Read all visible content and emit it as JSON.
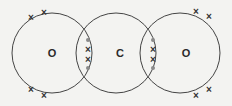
{
  "diagram": {
    "atoms": [
      {
        "label": "O",
        "element": "oxygen",
        "position": "left"
      },
      {
        "label": "C",
        "element": "carbon",
        "position": "center"
      },
      {
        "label": "O",
        "element": "oxygen",
        "position": "right"
      }
    ],
    "bonds": [
      {
        "between": [
          "O",
          "C"
        ],
        "type": "double",
        "electrons": [
          "dot",
          "cross",
          "cross",
          "dot"
        ]
      },
      {
        "between": [
          "C",
          "O"
        ],
        "type": "double",
        "electrons": [
          "dot",
          "cross",
          "cross",
          "dot"
        ]
      }
    ],
    "lone_pairs": {
      "left_oxygen": [
        "cross",
        "cross",
        "cross",
        "cross"
      ],
      "right_oxygen": [
        "cross",
        "cross",
        "cross",
        "cross"
      ]
    },
    "symbols": {
      "cross": "×",
      "dot": "•"
    },
    "colors": {
      "line": "#444444",
      "dot": "#8a8a8a",
      "cross": "#333333",
      "background": "#f3f3f1"
    }
  }
}
